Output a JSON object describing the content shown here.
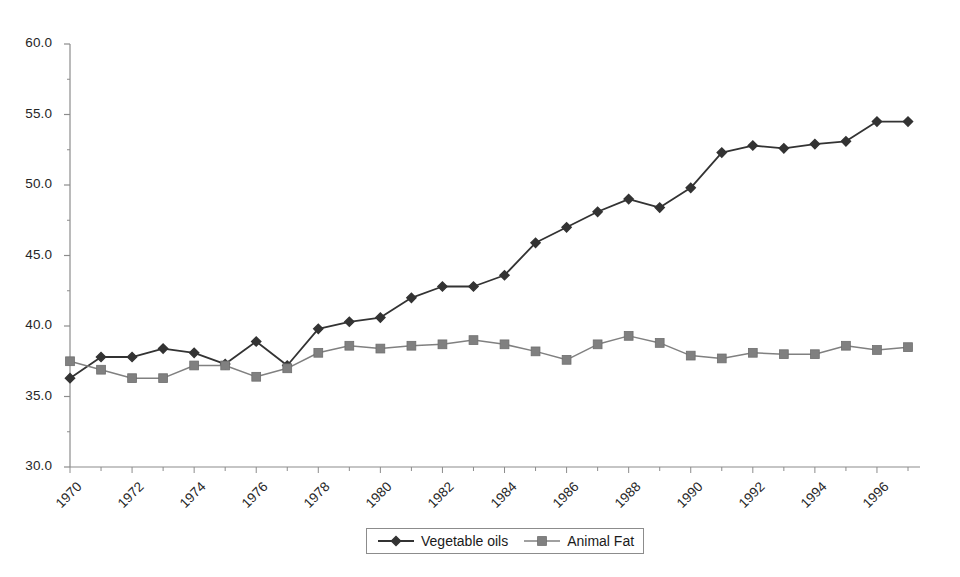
{
  "chart_data": {
    "type": "line",
    "title": "",
    "subtitle": "",
    "xlabel": "",
    "ylabel": "",
    "xlim": [
      1970,
      1997
    ],
    "ylim": [
      30.0,
      60.0
    ],
    "yticks": [
      "60.0",
      "55.0",
      "50.0",
      "45.0",
      "40.0",
      "35.0",
      "30.0"
    ],
    "ytick_values": [
      60.0,
      55.0,
      50.0,
      45.0,
      40.0,
      35.0,
      30.0
    ],
    "xticks": [
      "1970",
      "1972",
      "1974",
      "1976",
      "1978",
      "1980",
      "1982",
      "1984",
      "1986",
      "1988",
      "1990",
      "1992",
      "1994",
      "1996"
    ],
    "xtick_values": [
      1970,
      1972,
      1974,
      1976,
      1978,
      1980,
      1982,
      1984,
      1986,
      1988,
      1990,
      1992,
      1994,
      1996
    ],
    "minor_xticks_every": 1,
    "grid": false,
    "legend_position": "bottom-center",
    "x": [
      1970,
      1971,
      1972,
      1973,
      1974,
      1975,
      1976,
      1977,
      1978,
      1979,
      1980,
      1981,
      1982,
      1983,
      1984,
      1985,
      1986,
      1987,
      1988,
      1989,
      1990,
      1991,
      1992,
      1993,
      1994,
      1995,
      1996,
      1997
    ],
    "series": [
      {
        "name": "Vegetable oils",
        "color": "#333333",
        "marker": "diamond",
        "values": [
          36.3,
          37.8,
          37.8,
          38.4,
          38.1,
          37.3,
          38.9,
          37.2,
          39.8,
          40.3,
          40.6,
          42.0,
          42.8,
          42.8,
          43.6,
          45.9,
          47.0,
          48.1,
          49.0,
          48.4,
          49.8,
          52.3,
          52.8,
          52.6,
          52.9,
          53.1,
          54.5,
          54.5
        ]
      },
      {
        "name": "Animal Fat",
        "color": "#808080",
        "marker": "square",
        "values": [
          37.5,
          36.9,
          36.3,
          36.3,
          37.2,
          37.2,
          36.4,
          37.0,
          38.1,
          38.6,
          38.4,
          38.6,
          38.7,
          39.0,
          38.7,
          38.2,
          37.6,
          38.7,
          39.3,
          38.8,
          37.9,
          37.7,
          38.1,
          38.0,
          38.0,
          38.6,
          38.3,
          38.5
        ]
      }
    ]
  },
  "legend": {
    "items": [
      {
        "label": "Vegetable oils",
        "marker": "diamond-marker",
        "color": "#333333"
      },
      {
        "label": "Animal Fat",
        "marker": "square-marker",
        "color": "#808080"
      }
    ]
  },
  "axes": {
    "axis_color": "#8c8c8c",
    "tick_color": "#8c8c8c"
  }
}
